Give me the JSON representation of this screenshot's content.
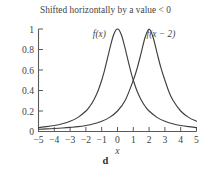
{
  "figure": {
    "title": "Shifted horizontally by a value < 0",
    "caption": "d",
    "background_color": "#ffffff",
    "ink_color": "#3f3f3f"
  },
  "chart_data": {
    "type": "line",
    "title": "Shifted horizontally by a value < 0",
    "subtitle": "",
    "xlabel": "x",
    "ylabel": "",
    "caption": "d",
    "xlim": [
      -5,
      5
    ],
    "ylim": [
      0,
      1.08
    ],
    "xticks": [
      -5,
      -4,
      -3,
      -2,
      -1,
      0,
      1,
      2,
      3,
      4,
      5
    ],
    "xtick_labels": [
      "−5",
      "−4",
      "−3",
      "−2",
      "−1",
      "0",
      "1",
      "2",
      "3",
      "4",
      "5"
    ],
    "yticks": [
      0,
      0.2,
      0.4,
      0.6,
      0.8,
      1
    ],
    "ytick_labels": [
      "0",
      "0.2",
      "0.4",
      "0.6",
      "0.8",
      "1"
    ],
    "grid": false,
    "legend": "inline-annotations",
    "annotations": [
      {
        "text": "f(x)",
        "x": -1.15,
        "y": 0.92
      },
      {
        "text": "f(x − 2)",
        "x": 2.75,
        "y": 0.92
      }
    ],
    "series": [
      {
        "name": "f(x)",
        "label": "f(x)",
        "color": "#3f3f3f",
        "peak_x": 0,
        "peak_y": 1,
        "x": [
          -5,
          -4.5,
          -4,
          -3.5,
          -3,
          -2.5,
          -2,
          -1.75,
          -1.5,
          -1.25,
          -1,
          -0.85,
          -0.7,
          -0.55,
          -0.4,
          -0.25,
          -0.1,
          0,
          0.1,
          0.25,
          0.4,
          0.55,
          0.7,
          0.85,
          1,
          1.25,
          1.5,
          1.75,
          2,
          2.5,
          3,
          3.5,
          4,
          4.5,
          5
        ],
        "y": [
          0.038,
          0.047,
          0.059,
          0.076,
          0.1,
          0.138,
          0.2,
          0.246,
          0.308,
          0.39,
          0.5,
          0.58,
          0.671,
          0.768,
          0.862,
          0.941,
          0.99,
          1,
          0.99,
          0.941,
          0.862,
          0.768,
          0.671,
          0.58,
          0.5,
          0.39,
          0.308,
          0.246,
          0.2,
          0.138,
          0.1,
          0.076,
          0.059,
          0.047,
          0.038
        ]
      },
      {
        "name": "f(x - 2)",
        "label": "f(x − 2)",
        "color": "#3f3f3f",
        "peak_x": 2,
        "peak_y": 1,
        "x": [
          -5,
          -4.5,
          -4,
          -3.5,
          -3,
          -2.5,
          -2,
          -1.5,
          -1,
          -0.5,
          0,
          0.5,
          1,
          1.25,
          1.5,
          1.75,
          2,
          2.25,
          2.5,
          2.75,
          3,
          3.25,
          3.5,
          4,
          4.5,
          5
        ],
        "y": [
          0.022,
          0.025,
          0.029,
          0.034,
          0.04,
          0.047,
          0.059,
          0.076,
          0.1,
          0.138,
          0.2,
          0.308,
          0.5,
          0.62,
          0.768,
          0.92,
          1,
          0.92,
          0.768,
          0.62,
          0.5,
          0.39,
          0.308,
          0.2,
          0.138,
          0.1
        ]
      }
    ]
  }
}
